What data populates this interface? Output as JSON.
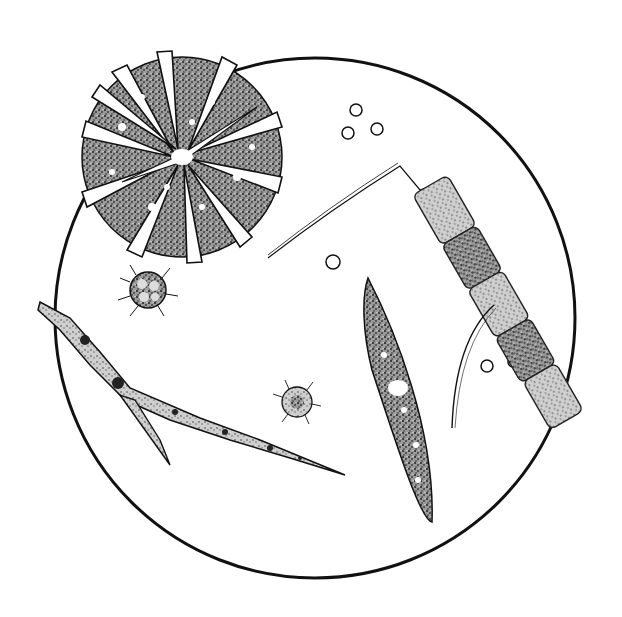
{
  "illustration": {
    "style": "pen-and-ink stipple drawing",
    "colors": {
      "background": "#ffffff",
      "ink": "#111111",
      "stipple": "#555555"
    },
    "field_of_view": {
      "shape": "circle",
      "cx": 315,
      "cy": 318,
      "r": 260
    },
    "organisms": [
      {
        "name": "radial-desmid-colony",
        "label": ""
      },
      {
        "name": "filament-branching-left",
        "label": ""
      },
      {
        "name": "filament-chain-right",
        "label": ""
      },
      {
        "name": "spindle-cell-center",
        "label": ""
      },
      {
        "name": "spiny-cyst-small-left",
        "label": ""
      },
      {
        "name": "spiny-cyst-small-center",
        "label": ""
      },
      {
        "name": "spore-cluster-top",
        "label": ""
      },
      {
        "name": "spore-pair-right",
        "label": ""
      },
      {
        "name": "spore-single-center",
        "label": ""
      }
    ]
  }
}
